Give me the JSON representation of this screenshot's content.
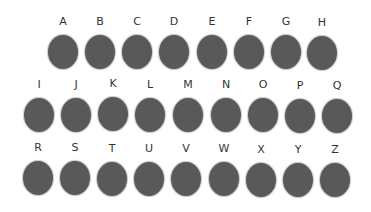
{
  "colors": {
    "circle": "#595959",
    "label": "#333333",
    "background": "#ffffff"
  },
  "rows": [
    {
      "items": [
        {
          "letter": "A",
          "x": 45,
          "y": 16
        },
        {
          "letter": "B",
          "x": 82,
          "y": 16
        },
        {
          "letter": "C",
          "x": 119,
          "y": 16
        },
        {
          "letter": "D",
          "x": 156,
          "y": 16
        },
        {
          "letter": "E",
          "x": 194,
          "y": 16
        },
        {
          "letter": "F",
          "x": 231,
          "y": 16
        },
        {
          "letter": "G",
          "x": 268,
          "y": 16
        },
        {
          "letter": "H",
          "x": 304,
          "y": 17
        }
      ]
    },
    {
      "items": [
        {
          "letter": "I",
          "x": 21,
          "y": 79
        },
        {
          "letter": "J",
          "x": 58,
          "y": 79
        },
        {
          "letter": "K",
          "x": 95,
          "y": 78
        },
        {
          "letter": "L",
          "x": 132,
          "y": 79
        },
        {
          "letter": "M",
          "x": 170,
          "y": 79
        },
        {
          "letter": "N",
          "x": 208,
          "y": 79
        },
        {
          "letter": "O",
          "x": 245,
          "y": 79
        },
        {
          "letter": "P",
          "x": 282,
          "y": 80
        },
        {
          "letter": "Q",
          "x": 319,
          "y": 80
        }
      ]
    },
    {
      "items": [
        {
          "letter": "R",
          "x": 20,
          "y": 142
        },
        {
          "letter": "S",
          "x": 57,
          "y": 142
        },
        {
          "letter": "T",
          "x": 94,
          "y": 143
        },
        {
          "letter": "U",
          "x": 131,
          "y": 143
        },
        {
          "letter": "V",
          "x": 168,
          "y": 143
        },
        {
          "letter": "W",
          "x": 206,
          "y": 143
        },
        {
          "letter": "X",
          "x": 243,
          "y": 144
        },
        {
          "letter": "Y",
          "x": 280,
          "y": 144
        },
        {
          "letter": "Z",
          "x": 317,
          "y": 144
        }
      ]
    }
  ]
}
